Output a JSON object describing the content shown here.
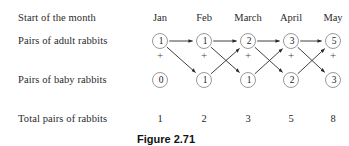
{
  "figure": {
    "caption": "Figure 2.71",
    "caption_x": 166,
    "caption_y": 133
  },
  "row_labels": [
    {
      "text": "Start of the month",
      "x": 18,
      "y": 12
    },
    {
      "text": "Pairs of adult rabbits",
      "x": 18,
      "y": 35
    },
    {
      "text": "Pairs of baby rabbits",
      "x": 18,
      "y": 74
    },
    {
      "text": "Total pairs of rabbits",
      "x": 18,
      "y": 113
    }
  ],
  "columns": [
    {
      "month": "Jan",
      "x": 160
    },
    {
      "month": "Feb",
      "x": 204
    },
    {
      "month": "March",
      "x": 248
    },
    {
      "month": "April",
      "x": 291
    },
    {
      "month": "May",
      "x": 333
    }
  ],
  "rows": {
    "adults": {
      "y": 35,
      "values": [
        1,
        1,
        2,
        3,
        5
      ]
    },
    "babies": {
      "y": 74,
      "values": [
        0,
        1,
        1,
        2,
        3
      ]
    },
    "totals": {
      "y": 113,
      "values": [
        1,
        2,
        3,
        5,
        8
      ]
    }
  },
  "plus_signs": {
    "y": 55,
    "x": [
      160,
      204,
      248,
      291,
      333
    ],
    "symbol": "+"
  },
  "chart_data": {
    "type": "diagram",
    "title": "Figure 2.71",
    "categories": [
      "Jan",
      "Feb",
      "March",
      "April",
      "May"
    ],
    "series": [
      {
        "name": "Pairs of adult rabbits",
        "values": [
          1,
          1,
          2,
          3,
          5
        ]
      },
      {
        "name": "Pairs of baby rabbits",
        "values": [
          0,
          1,
          1,
          2,
          3
        ]
      },
      {
        "name": "Total pairs of rabbits",
        "values": [
          1,
          2,
          3,
          5,
          8
        ]
      }
    ],
    "xlabel": "Start of the month",
    "ylabel": "",
    "legend": "none",
    "grid": false,
    "edges": [
      {
        "from": "adults.Jan",
        "to": "adults.Feb",
        "kind": "horizontal"
      },
      {
        "from": "adults.Feb",
        "to": "adults.March",
        "kind": "horizontal"
      },
      {
        "from": "adults.March",
        "to": "adults.April",
        "kind": "horizontal"
      },
      {
        "from": "adults.April",
        "to": "adults.May",
        "kind": "horizontal"
      },
      {
        "from": "adults.Jan",
        "to": "babies.Feb",
        "kind": "diagonal-down"
      },
      {
        "from": "adults.Feb",
        "to": "babies.March",
        "kind": "diagonal-down"
      },
      {
        "from": "adults.March",
        "to": "babies.April",
        "kind": "diagonal-down"
      },
      {
        "from": "adults.April",
        "to": "babies.May",
        "kind": "diagonal-down"
      },
      {
        "from": "babies.Feb",
        "to": "adults.March",
        "kind": "diagonal-up"
      },
      {
        "from": "babies.March",
        "to": "adults.April",
        "kind": "diagonal-up"
      },
      {
        "from": "babies.April",
        "to": "adults.May",
        "kind": "diagonal-up"
      }
    ]
  },
  "colors": {
    "background": "#ffffff",
    "text": "#1a1a1a",
    "node_stroke": "#9a9a9a",
    "edge": "#2a2a2a"
  }
}
